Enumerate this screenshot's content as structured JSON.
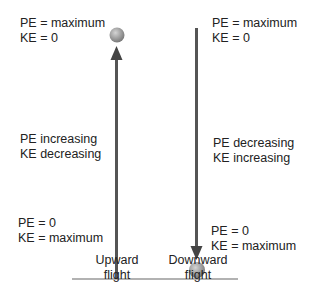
{
  "diagram": {
    "colors": {
      "arrow": "#555555",
      "ball_light": "#c9c9c9",
      "ball_dark": "#7d7d7d",
      "ground": "#666666",
      "text": "#222222"
    },
    "upward": {
      "top_label": {
        "line1": "PE = maximum",
        "line2": "KE = 0"
      },
      "middle_label": {
        "line1": "PE increasing",
        "line2": "KE decreasing"
      },
      "bottom_label": {
        "line1": "PE = 0",
        "line2": "KE = maximum"
      },
      "caption": {
        "line1": "Upward",
        "line2": "flight"
      }
    },
    "downward": {
      "top_label": {
        "line1": "PE = maximum",
        "line2": "KE = 0"
      },
      "middle_label": {
        "line1": "PE decreasing",
        "line2": "KE increasing"
      },
      "bottom_label": {
        "line1": "PE = 0",
        "line2": "KE = maximum"
      },
      "caption": {
        "line1": "Downward",
        "line2": "flight"
      }
    }
  }
}
